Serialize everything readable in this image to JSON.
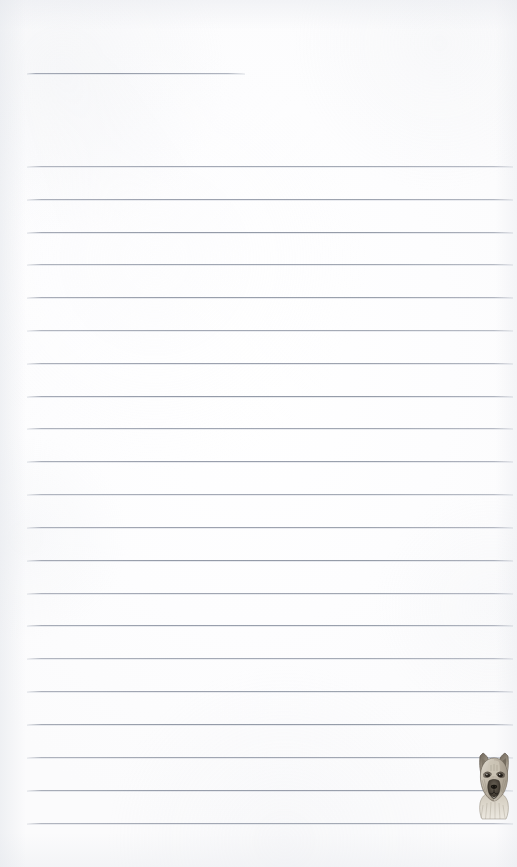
{
  "page": {
    "type": "lined-notepad-page",
    "width": 517,
    "height": 867,
    "background_color": "#fdfdfe",
    "paper_tint": "#fbfbfc"
  },
  "ruling": {
    "line_color": "#8e95a0",
    "line_secondary_color": "#cdd1d9",
    "line_thickness_px": 1,
    "left_margin_px": 27,
    "right_margin_px": 513,
    "line_spacing_px": 32.85,
    "header_rule": {
      "name": "short-header-rule",
      "x_start": 27,
      "x_end": 245,
      "y": 73
    },
    "full_rules_y": [
      166,
      199,
      232,
      264,
      297,
      330,
      363,
      396,
      428,
      461,
      494,
      527,
      560,
      593,
      625,
      658,
      691,
      724,
      757,
      790,
      823
    ],
    "full_rule_count": 21
  },
  "illustration": {
    "name": "german-shepherd-dog-head",
    "description": "Pencil-style drawing of a German Shepherd dog head, front facing, upright pointed ears",
    "position": {
      "x": 471,
      "y": 748,
      "width": 46,
      "height": 72
    },
    "colors": {
      "fur_light": "#d8d2c6",
      "fur_mid": "#a89e8e",
      "fur_dark": "#6d6458",
      "muzzle_dark": "#3c362e",
      "outline": "#4a443b"
    }
  },
  "content": {
    "written_text": "",
    "note": "Page is blank — no handwriting or printed text present"
  }
}
